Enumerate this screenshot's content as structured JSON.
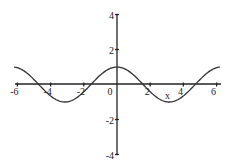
{
  "chart_data": {
    "type": "line",
    "title": "",
    "xlabel": "x",
    "ylabel": "",
    "function": "cos(x)",
    "xlim": [
      -6.2,
      6.2
    ],
    "ylim": [
      -4,
      4
    ],
    "grid": false,
    "legend": null,
    "x_ticks": [
      -6,
      -4,
      -2,
      0,
      2,
      4,
      6
    ],
    "x_tick_labels": [
      "-6",
      "-4",
      "-2",
      "0",
      "2",
      "4",
      "6"
    ],
    "y_ticks": [
      4,
      2,
      -2,
      -4
    ],
    "y_tick_labels": [
      "4",
      "2",
      "-2",
      "-4"
    ],
    "series": [
      {
        "name": "cos(x)",
        "x": [
          -6.2,
          -6,
          -5,
          -4,
          -3.14,
          -3,
          -2,
          -1.57,
          -1,
          0,
          1,
          1.57,
          2,
          3,
          3.14,
          4,
          4.71,
          5,
          6,
          6.2
        ],
        "y": [
          1.0,
          0.96,
          0.28,
          -0.65,
          -1.0,
          -0.99,
          -0.42,
          0.0,
          0.54,
          1.0,
          0.54,
          0.0,
          -0.42,
          -0.99,
          -1.0,
          -0.65,
          0.0,
          0.28,
          0.96,
          1.0
        ]
      }
    ],
    "color": "#333333"
  },
  "axis_label_x": "x"
}
